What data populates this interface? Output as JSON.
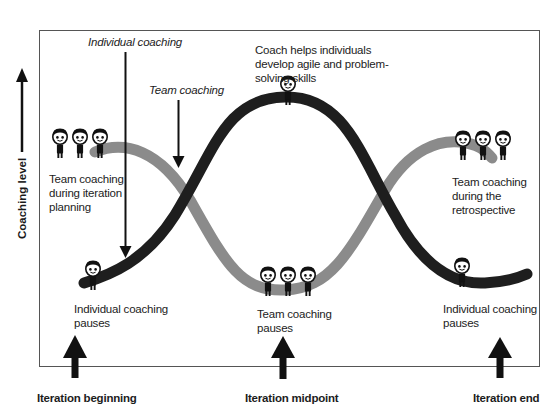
{
  "diagram": {
    "type": "coaching-level-over-iteration",
    "y_axis": {
      "label": "Coaching level",
      "direction": "up"
    },
    "series": [
      {
        "name": "Individual coaching",
        "color": "#1e1e1e",
        "shape": "low-high-low"
      },
      {
        "name": "Team coaching",
        "color": "#8a8a8a",
        "shape": "high-low-high"
      }
    ],
    "pointers": {
      "individual": "Individual coaching",
      "team": "Team coaching"
    },
    "annotations": {
      "peak": "Coach helps individuals develop agile and problem-solving skills",
      "planning_line1": "Team coaching",
      "planning_line2": "during iteration",
      "planning_line3": "planning",
      "retro_line1": "Team coaching",
      "retro_line2": "during the",
      "retro_line3": "retrospective",
      "indiv_pause_left_line1": "Individual coaching",
      "indiv_pause_left_line2": "pauses",
      "team_pause_line1": "Team coaching",
      "team_pause_line2": "pauses",
      "indiv_pause_right_line1": "Individual coaching",
      "indiv_pause_right_line2": "pauses"
    },
    "timeline": {
      "start": "Iteration beginning",
      "mid": "Iteration midpoint",
      "end": "Iteration end"
    }
  }
}
